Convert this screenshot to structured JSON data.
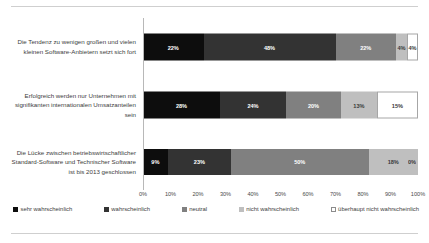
{
  "chart_data": {
    "type": "bar",
    "orientation": "horizontal",
    "stacked": true,
    "stack_mode": "percent",
    "title": "",
    "subtitle": "",
    "xlabel": "",
    "ylabel": "",
    "xlim": [
      0,
      100
    ],
    "grid": false,
    "legend_position": "bottom",
    "categories": [
      "Die Tendenz zu wenigen großen und vielen kleinen Software-Anbietern setzt sich fort",
      "Erfolgreich werden nur Unternehmen mit signifikanten internationalen Umsatzanteilen sein",
      "Die Lücke zwischen betriebswirtschaftlicher Standard-Software und Technischer Software ist bis 2013 geschlossen"
    ],
    "series": [
      {
        "name": "sehr wahrscheinlich",
        "color": "#0d0d0d",
        "values": [
          22,
          28,
          9
        ]
      },
      {
        "name": "wahrscheinlich",
        "color": "#333333",
        "values": [
          48,
          24,
          23
        ]
      },
      {
        "name": "neutral",
        "color": "#808080",
        "values": [
          22,
          20,
          50
        ]
      },
      {
        "name": "nicht wahrscheinlich",
        "color": "#bfbfbf",
        "values": [
          4,
          13,
          18
        ]
      },
      {
        "name": "überhaupt nicht wahrscheinlich",
        "color": "#ffffff",
        "values": [
          4,
          15,
          0
        ]
      }
    ],
    "value_labels": [
      [
        "22%",
        "48%",
        "22%",
        "4%",
        "4%"
      ],
      [
        "28%",
        "24%",
        "20%",
        "13%",
        "15%"
      ],
      [
        "9%",
        "23%",
        "50%",
        "18%",
        "0%"
      ]
    ],
    "xticks": [
      0,
      10,
      20,
      30,
      40,
      50,
      60,
      70,
      80,
      90,
      100
    ],
    "xtick_labels": [
      "0%",
      "10%",
      "20%",
      "30%",
      "40%",
      "50%",
      "60%",
      "70%",
      "80%",
      "90%",
      "100%"
    ]
  },
  "legend": {
    "items": [
      {
        "label": "sehr wahrscheinlich"
      },
      {
        "label": "wahrscheinlich"
      },
      {
        "label": "neutral"
      },
      {
        "label": "nicht wahrscheinlich"
      },
      {
        "label": "überhaupt nicht wahrscheinlich"
      }
    ]
  }
}
